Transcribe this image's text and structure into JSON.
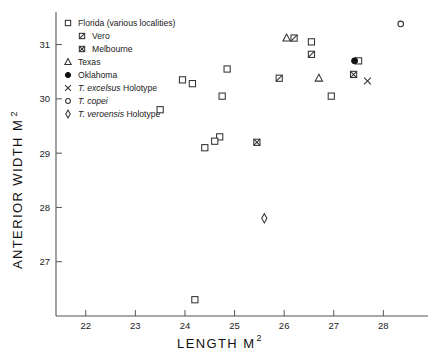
{
  "chart_data": {
    "type": "scatter",
    "title": "",
    "xlabel": "LENGTH M2",
    "ylabel": "ANTERIOR WIDTH M2",
    "xlabel_base": "LENGTH  M",
    "xlabel_sup": "2",
    "ylabel_base": "ANTERIOR  WIDTH  M",
    "ylabel_sup": "2",
    "xlim": [
      21.4,
      28.9
    ],
    "ylim": [
      26.0,
      31.6
    ],
    "xticks": [
      22,
      23,
      24,
      25,
      26,
      27,
      28
    ],
    "yticks": [
      27,
      28,
      29,
      30,
      31
    ],
    "xtick_labels": [
      "22",
      "23",
      "24",
      "25",
      "26",
      "27",
      "28"
    ],
    "ytick_labels": [
      "27",
      "28",
      "29",
      "30",
      "31"
    ],
    "grid": false,
    "legend_position": "upper-left-inside",
    "series": [
      {
        "name": "Florida (various localities)",
        "marker": "open-square",
        "points": [
          [
            26.55,
            31.05
          ],
          [
            24.85,
            30.55
          ],
          [
            23.95,
            30.35
          ],
          [
            24.15,
            30.28
          ],
          [
            24.75,
            30.05
          ],
          [
            23.5,
            29.8
          ],
          [
            24.7,
            29.3
          ],
          [
            24.6,
            29.22
          ],
          [
            24.4,
            29.1
          ],
          [
            26.95,
            30.05
          ],
          [
            27.5,
            30.7
          ],
          [
            24.2,
            26.3
          ]
        ]
      },
      {
        "name": "Vero",
        "marker": "square-slash",
        "points": [
          [
            26.2,
            31.12
          ],
          [
            26.55,
            30.82
          ],
          [
            25.9,
            30.38
          ]
        ]
      },
      {
        "name": "Melbourne",
        "marker": "square-crossed",
        "points": [
          [
            25.45,
            29.2
          ],
          [
            27.4,
            30.45
          ]
        ]
      },
      {
        "name": "Texas",
        "marker": "open-triangle",
        "points": [
          [
            26.05,
            31.12
          ],
          [
            26.7,
            30.38
          ]
        ]
      },
      {
        "name": "Oklahoma",
        "marker": "filled-circle",
        "points": [
          [
            27.42,
            30.7
          ]
        ]
      },
      {
        "name": "T. excelsus Holotype",
        "marker": "cross-x",
        "points": [
          [
            27.68,
            30.33
          ]
        ]
      },
      {
        "name": "T. copei",
        "marker": "open-circle",
        "points": [
          [
            28.35,
            31.38
          ]
        ]
      },
      {
        "name": "T. veroensis Holotype",
        "marker": "open-diamond",
        "points": [
          [
            25.6,
            27.8
          ]
        ]
      }
    ]
  },
  "legend": {
    "items": [
      {
        "marker": "open-square",
        "label": "Florida  (various localities)",
        "italic_part": "",
        "indent": 0
      },
      {
        "marker": "square-slash",
        "label": "Vero",
        "italic_part": "",
        "indent": 1
      },
      {
        "marker": "square-crossed",
        "label": "Melbourne",
        "italic_part": "",
        "indent": 1
      },
      {
        "marker": "open-triangle",
        "label": "Texas",
        "italic_part": "",
        "indent": 0
      },
      {
        "marker": "filled-circle",
        "label": "Oklahoma",
        "italic_part": "",
        "indent": 0
      },
      {
        "marker": "cross-x",
        "label": "Holotype",
        "italic_part": "T. excelsus",
        "indent": 0
      },
      {
        "marker": "open-circle",
        "label": "",
        "italic_part": "T. copei",
        "indent": 0
      },
      {
        "marker": "open-diamond",
        "label": "Holotype",
        "italic_part": "T. veroensis",
        "indent": 0
      }
    ]
  },
  "colors": {
    "marker_stroke": "#333333",
    "marker_fill": "#ffffff",
    "filled_marker": "#111111",
    "axis": "#555555",
    "text": "#1a1a1a",
    "background": "#ffffff"
  }
}
